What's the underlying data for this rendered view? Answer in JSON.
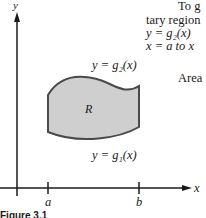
{
  "figure": {
    "y_axis_label": "y",
    "x_axis_label": "x",
    "tick_a": "a",
    "tick_b": "b",
    "region_label": "R",
    "upper_curve_label": "y  =  g₂(x)",
    "lower_curve_label": "y  =  g₁(x)",
    "caption": "Figure 3.1",
    "colors": {
      "region_fill": "#cfcfcf",
      "stroke": "#4a4a4a",
      "axis": "#1a1a1a"
    }
  },
  "text": {
    "line1": "To g",
    "line2": "tary region",
    "line3": "y  =  g₂(x)",
    "line4": "x  =  a to x",
    "line5": "Area"
  }
}
